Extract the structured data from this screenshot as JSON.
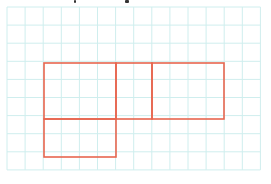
{
  "figure": {
    "caption_fragments": [
      {
        "x": 74,
        "w": 2
      },
      {
        "x": 125,
        "w": 4
      }
    ],
    "grid": {
      "origin_x": 7,
      "origin_y": 7,
      "cell": 18.1,
      "cols": 14,
      "rows": 9,
      "color": "#cfeeee"
    },
    "shapes": {
      "color": "#e8664f",
      "stroke_width": 1.6,
      "rectangles": [
        {
          "name": "square-lower-left",
          "x1": 44,
          "y1": 119,
          "x2": 116,
          "y2": 157
        },
        {
          "name": "rect-upper-left",
          "x1": 44,
          "y1": 63,
          "x2": 116,
          "y2": 119
        },
        {
          "name": "rect-upper-middle",
          "x1": 116,
          "y1": 63,
          "x2": 152,
          "y2": 119
        },
        {
          "name": "rect-upper-right",
          "x1": 152,
          "y1": 63,
          "x2": 224,
          "y2": 119
        }
      ]
    }
  }
}
